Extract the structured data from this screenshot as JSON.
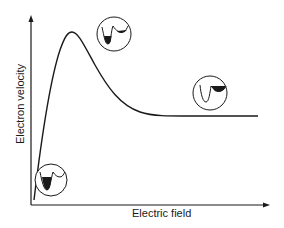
{
  "diagram": {
    "x_axis_label": "Electric field",
    "y_axis_label": "Electron velocity",
    "curve": "velocity rises steeply to a peak at low field, then drops and saturates at a plateau (negative differential mobility)",
    "insets": [
      {
        "name": "low-field-inset",
        "description": "electrons fill the lower (left) valley"
      },
      {
        "name": "peak-inset",
        "description": "electrons mostly in lower valley, some in upper valley"
      },
      {
        "name": "high-field-inset",
        "description": "electrons transferred to the upper (right) valley"
      }
    ],
    "colors": {
      "line": "#1a1a1a",
      "background": "#ffffff"
    }
  }
}
